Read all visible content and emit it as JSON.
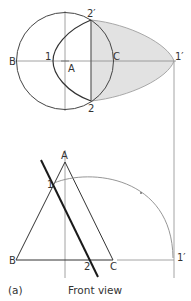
{
  "figure": {
    "caption_label": "(a)",
    "caption_title": "Front view",
    "colors": {
      "line": "#444444",
      "thin_line": "#8a8a8a",
      "shade": "#e2e2e2",
      "shade_edge": "#a8a8a8",
      "cut_line": "#1a1a1a"
    }
  },
  "top_view": {
    "labels": {
      "B": "B",
      "A": "A",
      "C": "C",
      "p1": "1",
      "p1_prime": "1′",
      "p2": "2",
      "p2_prime": "2′"
    }
  },
  "front_view": {
    "labels": {
      "A": "A",
      "B": "B",
      "C": "C",
      "p1": "1",
      "p2": "2",
      "p1_prime": "1′"
    }
  }
}
